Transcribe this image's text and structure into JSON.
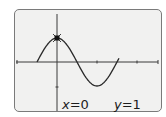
{
  "calculator_screen": {
    "graph": {
      "function": "cos(x)",
      "trace_point": {
        "x": 0,
        "y": 1
      },
      "colors": {
        "screen_bg": "#f1f1f0",
        "border": "#7a7a7a",
        "axis": "#3a3a3a",
        "curve": "#2a2a2a",
        "cursor": "#111111"
      }
    },
    "readout": {
      "x_label": "x",
      "x_value": "0",
      "y_label": "y",
      "y_value": "1",
      "equals": "="
    }
  }
}
